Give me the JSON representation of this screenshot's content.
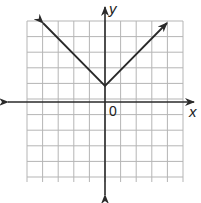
{
  "chart_data": {
    "type": "line",
    "title": "",
    "xlabel": "x",
    "ylabel": "y",
    "origin_label": "0",
    "xlim": [
      -6,
      4
    ],
    "ylim": [
      -5,
      5
    ],
    "grid": true,
    "grid_step": 1,
    "series": [
      {
        "name": "y = |x| + 1",
        "x": [
          -4,
          0,
          4
        ],
        "y": [
          5,
          1,
          5
        ],
        "arrows_at_ends": true
      }
    ],
    "colors": {
      "grid": "#b5b5b5",
      "axis": "#2a2a2a",
      "line": "#2a2a2a"
    }
  }
}
